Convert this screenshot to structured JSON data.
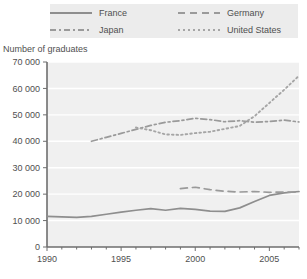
{
  "legend": {
    "items": [
      {
        "label": "France",
        "style": "solid"
      },
      {
        "label": "Germany",
        "style": "dashed"
      },
      {
        "label": "Japan",
        "style": "dashdot"
      },
      {
        "label": "United States",
        "style": "dotted"
      }
    ]
  },
  "axis_title": "Number of graduates",
  "colors": {
    "france": "#8e8e8e",
    "germany": "#9a9a9a",
    "japan": "#9a9a9a",
    "united_states": "#a5a5a5",
    "plot_background": "#f0f0f0",
    "gridline": "#ffffff",
    "axis": "#6e6e6e",
    "legend_background": "#ececec",
    "text": "#4f4f4f"
  },
  "chart_data": {
    "type": "line",
    "title": "",
    "xlabel": "",
    "ylabel": "Number of graduates",
    "xlim": [
      1990,
      2007
    ],
    "ylim": [
      0,
      70000
    ],
    "xticks": [
      1990,
      1995,
      2000,
      2005
    ],
    "xtick_labels": [
      "1990",
      "1995",
      "2000",
      "2005"
    ],
    "yticks": [
      0,
      10000,
      20000,
      30000,
      40000,
      50000,
      60000,
      70000
    ],
    "ytick_labels": [
      "0",
      "10 000",
      "20 000",
      "30 000",
      "40 000",
      "50 000",
      "60 000",
      "70 000"
    ],
    "grid": true,
    "legend_position": "top",
    "series": [
      {
        "name": "France",
        "style": "solid",
        "x": [
          1990,
          1991,
          1992,
          1993,
          1994,
          1995,
          1996,
          1997,
          1998,
          1999,
          2000,
          2001,
          2002,
          2003,
          2004,
          2005,
          2006,
          2007
        ],
        "values": [
          11600,
          11400,
          11200,
          11600,
          12400,
          13200,
          13900,
          14500,
          13900,
          14600,
          14200,
          13600,
          13500,
          14800,
          17200,
          19500,
          20500,
          21000
        ]
      },
      {
        "name": "Germany",
        "style": "dashed",
        "x": [
          1999,
          2000,
          2001,
          2002,
          2003,
          2004,
          2005,
          2006,
          2007
        ],
        "values": [
          22100,
          22600,
          21700,
          21100,
          20800,
          21000,
          20700,
          20800,
          20800
        ]
      },
      {
        "name": "Japan",
        "style": "dashdot",
        "x": [
          1993,
          1994,
          1995,
          1996,
          1997,
          1998,
          1999,
          2000,
          2001,
          2002,
          2003,
          2004,
          2005,
          2006,
          2007
        ],
        "values": [
          40000,
          41500,
          43000,
          44500,
          46000,
          47200,
          47800,
          48700,
          48200,
          47400,
          47800,
          47200,
          47500,
          48000,
          47300
        ]
      },
      {
        "name": "United States",
        "style": "dotted",
        "x": [
          1996,
          1997,
          1998,
          1999,
          2000,
          2001,
          2002,
          2003,
          2004,
          2005,
          2006,
          2007
        ],
        "values": [
          45200,
          44200,
          42600,
          42400,
          43100,
          43600,
          44700,
          45800,
          49500,
          54500,
          59500,
          64800
        ]
      }
    ]
  }
}
